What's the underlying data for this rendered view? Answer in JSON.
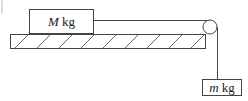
{
  "diagram": {
    "type": "physics-pulley",
    "block_on_table": {
      "label_var": "M",
      "label_unit": " kg"
    },
    "hanging_block": {
      "label_var": "m",
      "label_unit": " kg"
    },
    "colors": {
      "stroke": "#444444",
      "hatch": "#666666",
      "background": "#ffffff"
    }
  }
}
